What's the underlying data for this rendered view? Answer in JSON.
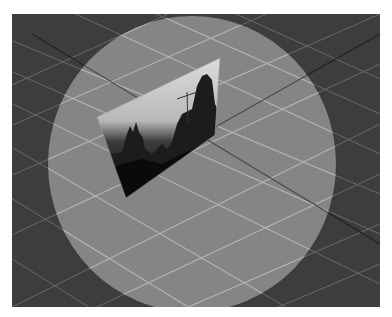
{
  "scene": {
    "description": "3D viewport: grey grid floor in perspective with a translucent circular spotlight and a tilted photo plane showing a city skyline",
    "background_color": "#3b3b3b",
    "spotlight_color": "#8a8a8a",
    "grid_line_color": "#9a9a9a",
    "photo_plane": {
      "subject": "city skyline with construction crane",
      "corners": [
        [
          85,
          103
        ],
        [
          208,
          44
        ],
        [
          203,
          121
        ],
        [
          114,
          184
        ]
      ]
    }
  }
}
